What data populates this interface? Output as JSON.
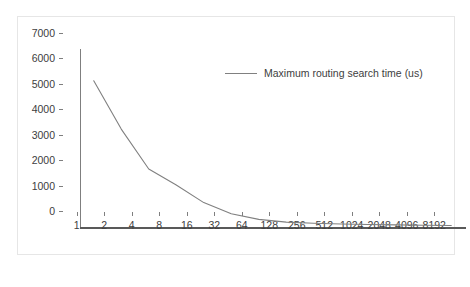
{
  "chart_data": {
    "type": "line",
    "title": "",
    "xlabel": "",
    "ylabel": "",
    "categories": [
      "1",
      "2",
      "4",
      "8",
      "16",
      "32",
      "64",
      "128",
      "256",
      "512",
      "1024",
      "2048",
      "4096",
      "8192"
    ],
    "series": [
      {
        "name": "Maximum routing search time (us)",
        "color": "#808080",
        "values": [
          5750,
          3850,
          2280,
          1650,
          960,
          520,
          300,
          190,
          150,
          120,
          100,
          85,
          70,
          60
        ]
      }
    ],
    "y_ticks": [
      0,
      1000,
      2000,
      3000,
      4000,
      5000,
      6000,
      7000
    ],
    "ylim": [
      0,
      7000
    ],
    "grid": false,
    "legend_position": "top-right",
    "legend_entries": [
      "Maximum routing search time (us)"
    ],
    "frame_color": "#e6e6e6",
    "axis_color": "#7f7f7f",
    "background": "#ffffff"
  }
}
